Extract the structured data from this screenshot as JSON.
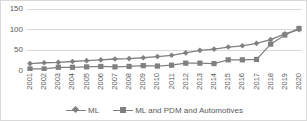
{
  "chart_data": {
    "type": "line",
    "title": "",
    "xlabel": "",
    "ylabel": "",
    "ylim": [
      0,
      150
    ],
    "yticks": [
      0,
      50,
      100,
      150
    ],
    "grid": true,
    "legend_position": "bottom",
    "categories": [
      "2001",
      "2002",
      "2003",
      "2004",
      "2005",
      "2006",
      "2007",
      "2008",
      "2009",
      "2010",
      "2011",
      "2012",
      "2013",
      "2014",
      "2015",
      "2016",
      "2017",
      "2018",
      "2019",
      "2020"
    ],
    "series": [
      {
        "name": "ML",
        "marker": "diamond",
        "color": "#808080",
        "values": [
          18,
          20,
          21,
          23,
          25,
          27,
          29,
          30,
          32,
          35,
          38,
          44,
          50,
          53,
          58,
          61,
          67,
          76,
          90,
          100
        ]
      },
      {
        "name": "ML and PDM and Automotives",
        "marker": "square",
        "color": "#808080",
        "values": [
          5,
          5,
          9,
          9,
          10,
          11,
          10,
          11,
          13,
          12,
          14,
          19,
          19,
          18,
          27,
          27,
          28,
          65,
          87,
          103
        ]
      }
    ]
  },
  "axis": {
    "y_tick_labels": [
      "150",
      "100",
      "50",
      "0"
    ],
    "x_tick_labels": [
      "2001",
      "2002",
      "2003",
      "2004",
      "2005",
      "2006",
      "2007",
      "2008",
      "2009",
      "2010",
      "2011",
      "2012",
      "2013",
      "2014",
      "2015",
      "2016",
      "2017",
      "2018",
      "2019",
      "2020"
    ]
  },
  "legend": {
    "items": [
      {
        "label": "ML",
        "marker": "diamond-marker"
      },
      {
        "label": "ML and PDM and Automotives",
        "marker": "square-marker"
      }
    ]
  },
  "colors": {
    "series": "#808080",
    "grid": "#d9d9d9",
    "text": "#595959",
    "background": "#ffffff"
  }
}
